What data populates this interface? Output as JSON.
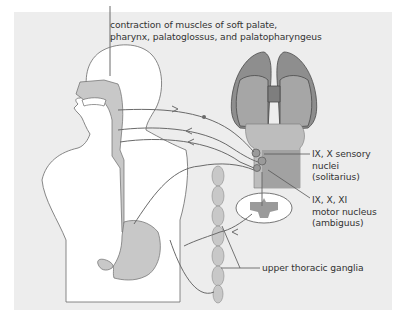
{
  "figure": {
    "colors": {
      "background": "#ffffff",
      "panel": "#ededed",
      "body_fill": "#ffffff",
      "organ_fill": "#c8c8c8",
      "lung_fill": "#8e8e8e",
      "lung_inner": "#a6a6a6",
      "brainstem_fill": "#bdbdbd",
      "nerve_line": "#6a6a6a",
      "text": "#333333"
    },
    "labels": {
      "top_line1": "contraction of muscles of soft palate,",
      "top_line2": "pharynx, palatoglossus, and palatopharyngeus",
      "sensory_line1": "IX, X sensory",
      "sensory_line2": "nuclei",
      "sensory_line3": "(solitarius)",
      "motor_line1": "IX, X, XI",
      "motor_line2": "motor nucleus",
      "motor_line3": "(ambiguus)",
      "ganglia": "upper thoracic ganglia"
    },
    "structures": [
      "head",
      "pharynx",
      "esophagus",
      "stomach",
      "lungs",
      "brainstem",
      "spinal-cord-section",
      "sympathetic-chain"
    ]
  }
}
